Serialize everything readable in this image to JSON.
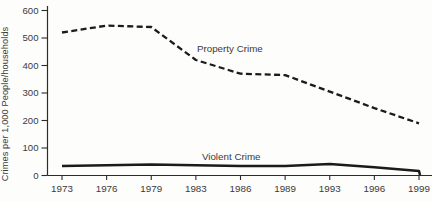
{
  "figure": {
    "background": "#fdfdfc",
    "line_color": "#1b1b1b",
    "axis_color": "#2b2b2b",
    "text_color": "#3a3a3a"
  },
  "chart_data": {
    "type": "line",
    "title": "",
    "xlabel": "",
    "ylabel": "Crimes per 1,000 People/households",
    "categories": [
      "1973",
      "1976",
      "1979",
      "1983",
      "1986",
      "1989",
      "1993",
      "1996",
      "1999"
    ],
    "y_ticks": [
      0,
      100,
      200,
      300,
      400,
      500,
      600
    ],
    "ylim": [
      0,
      600
    ],
    "grid": false,
    "legend_position": "inline-annotations",
    "series": [
      {
        "name": "Property Crime",
        "style": "dashed",
        "values": [
          520,
          545,
          540,
          420,
          370,
          365,
          305,
          245,
          190
        ]
      },
      {
        "name": "Violent Crime",
        "style": "solid",
        "values": [
          35,
          37,
          40,
          37,
          35,
          35,
          42,
          30,
          16
        ],
        "end_drop": true
      }
    ],
    "annotations": [
      {
        "text": "Property Crime",
        "x_frac": 0.378,
        "y": 450,
        "anchor": "start"
      },
      {
        "text": "Violent Crime",
        "x_frac": 0.392,
        "y": 56,
        "anchor": "start"
      }
    ]
  }
}
